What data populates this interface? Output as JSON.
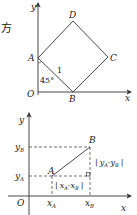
{
  "fragment_text": "方",
  "figure1": {
    "axis_x_label": "x",
    "axis_y_label": "y",
    "origin_label": "O",
    "points": {
      "A": {
        "label": "A"
      },
      "B": {
        "label": "B"
      },
      "C": {
        "label": "C"
      },
      "D": {
        "label": "D"
      }
    },
    "angle_label": "45°",
    "side_label": "1"
  },
  "figure2": {
    "axis_x_label": "x",
    "axis_y_label": "y",
    "origin_label": "O",
    "point_A_label": "A",
    "point_B_label": "B",
    "y_B_main": "y",
    "y_B_sub": "B",
    "y_A_main": "y",
    "y_A_sub": "A",
    "x_A_main": "x",
    "x_A_sub": "A",
    "x_B_main": "x",
    "x_B_sub": "B",
    "horizontal_diff": {
      "bar": "|",
      "a_main": "x",
      "a_sub": "A",
      "dash": "-",
      "b_main": "x",
      "b_sub": "B"
    },
    "vertical_diff": {
      "bar": "|",
      "a_main": "y",
      "a_sub": "A",
      "dash": "-",
      "b_main": "y",
      "b_sub": "B"
    }
  },
  "colors": {
    "line": "#333333",
    "text": "#222222"
  }
}
